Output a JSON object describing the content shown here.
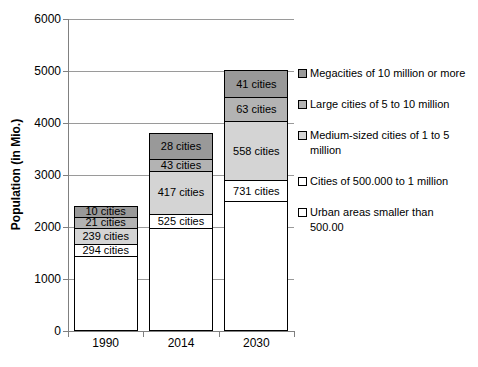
{
  "chart_data": {
    "type": "bar",
    "stacked": true,
    "stack_order": "bottom-to-top",
    "title": "",
    "xlabel": "",
    "ylabel": "Population (in Mio.)",
    "ylim": [
      0,
      6000
    ],
    "ytick_step": 1000,
    "y_tick_labels": [
      "0",
      "1000",
      "2000",
      "3000",
      "4000",
      "5000",
      "6000"
    ],
    "grid": true,
    "legend_position": "right",
    "categories": [
      "1990",
      "2014",
      "2030"
    ],
    "totals": [
      2380,
      3780,
      5000
    ],
    "series": [
      {
        "name": "Urban areas smaller than 500.00",
        "color": "#ffffff",
        "values": [
          1430,
          1960,
          2480
        ],
        "labels": null
      },
      {
        "name": "Cities of 500.000 to 1 million",
        "color": "#ffffff",
        "values": [
          220,
          280,
          400
        ],
        "labels": [
          "294 cities",
          "525 cities",
          "731 cities"
        ]
      },
      {
        "name": "Medium-sized cities of 1 to 5 million",
        "color": "#d4d4d4",
        "values": [
          320,
          820,
          1140
        ],
        "labels": [
          "239 cities",
          "417 cities",
          "558 cities"
        ]
      },
      {
        "name": "Large cities of 5 to 10 million",
        "color": "#b3b3b3",
        "values": [
          210,
          230,
          460
        ],
        "labels": [
          "21 cities",
          "43 cities",
          "63 cities"
        ]
      },
      {
        "name": "Megacities of 10 million or more",
        "color": "#999999",
        "values": [
          200,
          490,
          520
        ],
        "labels": [
          "10 cities",
          "28 cities",
          "41 cities"
        ]
      }
    ]
  },
  "legend": {
    "items": [
      {
        "label": "Megacities of 10 million or more",
        "display": "Megacities of 10 million or more",
        "color": "#999999"
      },
      {
        "label": "Large cities of 5 to 10 million",
        "display": "Large cities of 5 to 10 million",
        "color": "#b3b3b3"
      },
      {
        "label": "Medium-sized cities of 1 to 5 million",
        "display": "Medium-sized cities of 1 to 5\nmillion",
        "color": "#d4d4d4"
      },
      {
        "label": "Cities of 500.000 to 1 million",
        "display": "Cities of 500.000 to 1 million",
        "color": "#ffffff"
      },
      {
        "label": "Urban areas smaller than 500.00",
        "display": "Urban areas smaller than\n500.00",
        "color": "#ffffff"
      }
    ]
  },
  "colors": {
    "background": "#ffffff",
    "gridline": "#9a9a9a",
    "axis": "#808080",
    "text": "#000000",
    "segment_border": "#000000"
  }
}
